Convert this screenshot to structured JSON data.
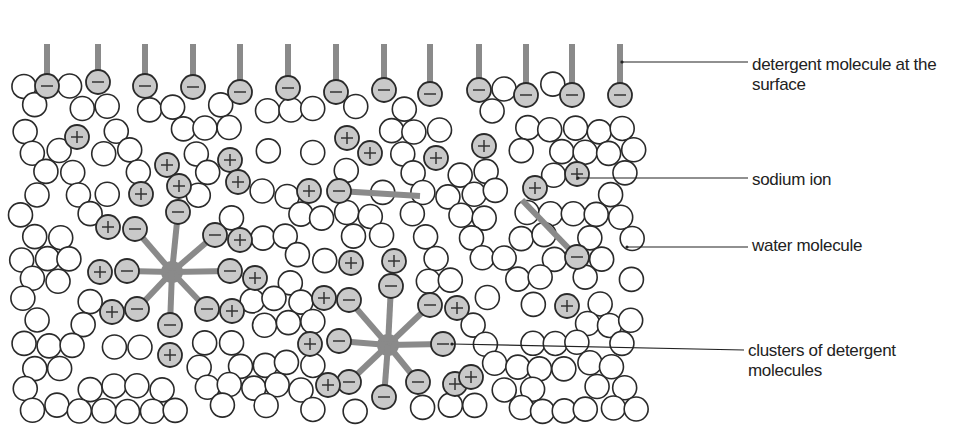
{
  "labels": [
    {
      "id": "surface",
      "lines": [
        "detergent molecule at the",
        "surface"
      ],
      "x": 752,
      "y": 56,
      "leader_from": [
        622,
        62
      ],
      "leader_to": [
        748,
        62
      ]
    },
    {
      "id": "sodium",
      "lines": [
        "sodium ion"
      ],
      "x": 752,
      "y": 172,
      "leader_from": [
        578,
        178
      ],
      "leader_to": [
        748,
        178
      ]
    },
    {
      "id": "water",
      "lines": [
        "water molecule"
      ],
      "x": 752,
      "y": 236,
      "leader_from": [
        627,
        247
      ],
      "leader_to": [
        748,
        247
      ]
    },
    {
      "id": "clusters",
      "lines": [
        "clusters of detergent",
        "molecules"
      ],
      "x": 748,
      "y": 342,
      "leader_from": [
        452,
        344
      ],
      "leader_to": [
        744,
        350
      ]
    }
  ],
  "colors": {
    "ion_fill": "#c9c9c9",
    "tail": "#8a8a8a",
    "outline": "#2a2a2a",
    "background": "#ffffff"
  },
  "molecule_radius": 12,
  "surface_detergents": [
    {
      "x": 47,
      "y": 86
    },
    {
      "x": 98,
      "y": 82
    },
    {
      "x": 145,
      "y": 86
    },
    {
      "x": 193,
      "y": 87
    },
    {
      "x": 240,
      "y": 92
    },
    {
      "x": 288,
      "y": 88
    },
    {
      "x": 336,
      "y": 92
    },
    {
      "x": 384,
      "y": 90
    },
    {
      "x": 430,
      "y": 94
    },
    {
      "x": 479,
      "y": 90
    },
    {
      "x": 526,
      "y": 95
    },
    {
      "x": 572,
      "y": 95
    },
    {
      "x": 620,
      "y": 95
    }
  ],
  "free_detergents": [
    {
      "head": [
        339,
        191
      ],
      "tail_end": [
        420,
        196
      ]
    },
    {
      "head": [
        577,
        257
      ],
      "tail_end": [
        522,
        200
      ]
    }
  ],
  "clusters": [
    {
      "center": [
        172,
        272
      ],
      "heads": [
        [
          178,
          212
        ],
        [
          135,
          229
        ],
        [
          215,
          235
        ],
        [
          127,
          271
        ],
        [
          230,
          271
        ],
        [
          137,
          309
        ],
        [
          207,
          309
        ],
        [
          170,
          325
        ]
      ],
      "ions": [
        [
          167,
          165
        ],
        [
          108,
          227
        ],
        [
          240,
          240
        ],
        [
          100,
          272
        ],
        [
          255,
          278
        ],
        [
          112,
          312
        ],
        [
          232,
          311
        ],
        [
          170,
          355
        ]
      ]
    },
    {
      "center": [
        388,
        345
      ],
      "heads": [
        [
          391,
          286
        ],
        [
          349,
          300
        ],
        [
          430,
          305
        ],
        [
          339,
          341
        ],
        [
          443,
          344
        ],
        [
          349,
          382
        ],
        [
          418,
          382
        ],
        [
          384,
          397
        ]
      ],
      "ions": [
        [
          394,
          261
        ],
        [
          324,
          298
        ],
        [
          457,
          308
        ],
        [
          310,
          344
        ],
        [
          455,
          384
        ],
        [
          328,
          385
        ],
        [
          471,
          377
        ]
      ]
    }
  ],
  "free_ions": [
    [
      77,
      137
    ],
    [
      230,
      160
    ],
    [
      347,
      138
    ],
    [
      370,
      153
    ],
    [
      436,
      158
    ],
    [
      484,
      146
    ],
    [
      179,
      186
    ],
    [
      141,
      194
    ],
    [
      238,
      182
    ],
    [
      309,
      191
    ],
    [
      535,
      188
    ],
    [
      577,
      174
    ],
    [
      351,
      263
    ],
    [
      567,
      306
    ]
  ]
}
